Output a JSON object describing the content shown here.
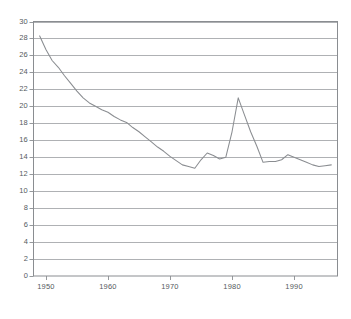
{
  "chart_data": {
    "type": "line",
    "title": "",
    "subtitle": "",
    "xlabel": "",
    "ylabel": "",
    "xlim": [
      1948,
      1997
    ],
    "ylim": [
      0,
      30
    ],
    "grid": true,
    "grid_axis": "y",
    "legend": null,
    "legend_position": "none",
    "annotations": [],
    "xticks": [
      1950,
      1960,
      1970,
      1980,
      1990
    ],
    "xtick_labels": [
      "1950",
      "1960",
      "1970",
      "1980",
      "1990"
    ],
    "yticks": [
      0,
      2,
      4,
      6,
      8,
      10,
      12,
      14,
      16,
      18,
      20,
      22,
      24,
      26,
      28,
      30
    ],
    "ytick_labels": [
      "0",
      "2",
      "4",
      "6",
      "8",
      "10",
      "12",
      "14",
      "16",
      "18",
      "20",
      "22",
      "24",
      "26",
      "28",
      "30"
    ],
    "line_color": "#8a8d91",
    "grid_color": "#9a9da1",
    "axis_color": "#8a8d91",
    "series": [
      {
        "name": "series-1",
        "x": [
          1949,
          1950,
          1951,
          1952,
          1953,
          1954,
          1955,
          1956,
          1957,
          1958,
          1959,
          1960,
          1961,
          1962,
          1963,
          1964,
          1965,
          1966,
          1967,
          1968,
          1969,
          1970,
          1971,
          1972,
          1973,
          1974,
          1975,
          1976,
          1977,
          1978,
          1979,
          1980,
          1981,
          1982,
          1983,
          1984,
          1985,
          1986,
          1987,
          1988,
          1989,
          1990,
          1991,
          1992,
          1993,
          1994,
          1995,
          1996
        ],
        "y": [
          28.3,
          26.7,
          25.4,
          24.6,
          23.6,
          22.7,
          21.8,
          21.0,
          20.4,
          20.0,
          19.6,
          19.3,
          18.8,
          18.4,
          18.1,
          17.5,
          17.0,
          16.4,
          15.8,
          15.2,
          14.7,
          14.1,
          13.6,
          13.1,
          12.9,
          12.7,
          13.7,
          14.5,
          14.2,
          13.8,
          14.0,
          17.0,
          21.0,
          19.0,
          17.0,
          15.3,
          13.4,
          13.5,
          13.5,
          13.7,
          14.3,
          14.0,
          13.7,
          13.4,
          13.1,
          12.9,
          13.0,
          13.1
        ]
      }
    ]
  }
}
